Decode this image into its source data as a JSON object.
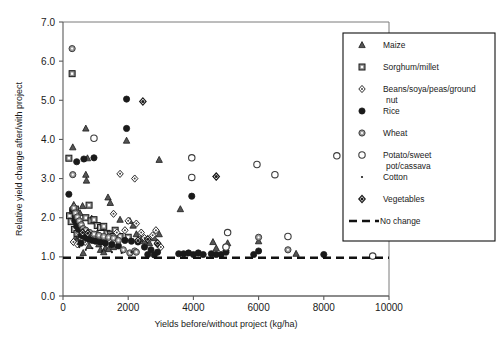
{
  "figure": {
    "faint_top_title": "",
    "background": "#ffffff"
  },
  "axes": {
    "y_title": "Relative yield change after/with project",
    "x_title": "Yields before/without project (kg/ha)",
    "y_ticks": [
      "0.0",
      "1.0",
      "2.0",
      "3.0",
      "4.0",
      "5.0",
      "6.0",
      "7.0"
    ],
    "x_ticks": [
      "0",
      "2000",
      "4000",
      "6000",
      "8000",
      "10000"
    ]
  },
  "legend": {
    "entries": [
      {
        "label": "Maize",
        "marker": "triangle-grey"
      },
      {
        "label": "Sorghum/millet",
        "marker": "square-grey"
      },
      {
        "label": "Beans/soya/peas/ground",
        "label2": "nut",
        "marker": "diamond-open"
      },
      {
        "label": "Rice",
        "marker": "circle-filled"
      },
      {
        "label": "Wheat",
        "marker": "circle-grey"
      },
      {
        "label": "Potato/sweet",
        "label2": "pot/cassava",
        "marker": "circle-open"
      },
      {
        "label": "Cotton",
        "marker": "dot-small"
      },
      {
        "label": "Vegetables",
        "marker": "diamond-grey"
      },
      {
        "label": "No change",
        "marker": "dashed-line"
      }
    ]
  },
  "chart_data": {
    "type": "scatter",
    "title": "",
    "xlabel": "Yields before/without project (kg/ha)",
    "ylabel": "Relative yield change after/with project",
    "xlim": [
      0,
      10000
    ],
    "ylim": [
      0.0,
      7.0
    ],
    "xticks": [
      0,
      2000,
      4000,
      6000,
      8000,
      10000
    ],
    "yticks": [
      0.0,
      1.0,
      2.0,
      3.0,
      4.0,
      5.0,
      6.0,
      7.0
    ],
    "grid": false,
    "legend_position": "right-inside",
    "reference_lines": [
      {
        "name": "No change",
        "orientation": "horizontal",
        "y": 1.0,
        "style": "dashed"
      }
    ],
    "series": [
      {
        "name": "Maize",
        "marker": "triangle-grey",
        "points": [
          [
            300,
            3.8
          ],
          [
            700,
            4.28
          ],
          [
            750,
            3.52
          ],
          [
            700,
            3.1
          ],
          [
            720,
            2.95
          ],
          [
            1950,
            3.97
          ],
          [
            2950,
            3.48
          ],
          [
            3600,
            2.22
          ],
          [
            1380,
            2.52
          ],
          [
            1450,
            2.38
          ],
          [
            330,
            2.33
          ],
          [
            360,
            2.05
          ],
          [
            520,
            2.12
          ],
          [
            600,
            2.3
          ],
          [
            880,
            1.98
          ],
          [
            1000,
            1.45
          ],
          [
            1100,
            1.32
          ],
          [
            1200,
            1.38
          ],
          [
            1300,
            1.22
          ],
          [
            1500,
            1.3
          ],
          [
            1750,
            1.95
          ],
          [
            2050,
            1.92
          ],
          [
            2150,
            1.8
          ],
          [
            2250,
            1.58
          ],
          [
            2400,
            1.45
          ],
          [
            2500,
            1.4
          ],
          [
            2650,
            1.35
          ],
          [
            2800,
            1.48
          ],
          [
            2950,
            1.58
          ],
          [
            4600,
            1.38
          ],
          [
            5050,
            1.35
          ],
          [
            6000,
            1.4
          ],
          [
            7150,
            1.08
          ],
          [
            1600,
            1.55
          ],
          [
            380,
            1.48
          ],
          [
            430,
            1.42
          ],
          [
            540,
            1.52
          ],
          [
            620,
            1.1
          ],
          [
            800,
            1.28
          ],
          [
            940,
            1.52
          ],
          [
            1050,
            1.6
          ],
          [
            1150,
            1.18
          ],
          [
            1250,
            1.12
          ],
          [
            1400,
            1.2
          ],
          [
            1550,
            1.25
          ],
          [
            5000,
            1.22
          ],
          [
            4700,
            1.22
          ]
        ]
      },
      {
        "name": "Sorghum/millet",
        "marker": "square-grey",
        "points": [
          [
            280,
            5.68
          ],
          [
            180,
            3.52
          ],
          [
            200,
            2.05
          ],
          [
            300,
            2.18
          ],
          [
            380,
            2.22
          ],
          [
            420,
            1.98
          ],
          [
            470,
            1.88
          ],
          [
            520,
            1.82
          ],
          [
            560,
            1.72
          ],
          [
            600,
            1.65
          ],
          [
            700,
            2.0
          ],
          [
            800,
            2.32
          ],
          [
            860,
            1.92
          ],
          [
            950,
            1.95
          ],
          [
            1050,
            1.8
          ],
          [
            1150,
            1.75
          ],
          [
            1250,
            1.78
          ],
          [
            1350,
            1.6
          ],
          [
            1450,
            1.58
          ],
          [
            1550,
            1.52
          ],
          [
            1750,
            1.52
          ],
          [
            2000,
            1.5
          ],
          [
            350,
            1.7
          ],
          [
            430,
            1.6
          ],
          [
            250,
            1.9
          ],
          [
            620,
            1.55
          ],
          [
            730,
            1.62
          ],
          [
            1600,
            1.68
          ]
        ]
      },
      {
        "name": "Beans/soya/peas/groundnut",
        "marker": "diamond-open",
        "points": [
          [
            1750,
            3.12
          ],
          [
            2200,
            3.0
          ],
          [
            2250,
            1.85
          ],
          [
            2000,
            1.92
          ],
          [
            1550,
            2.1
          ],
          [
            340,
            2.28
          ],
          [
            400,
            2.15
          ],
          [
            460,
            1.75
          ],
          [
            500,
            1.62
          ],
          [
            560,
            1.48
          ],
          [
            620,
            1.42
          ],
          [
            680,
            1.38
          ],
          [
            760,
            1.52
          ],
          [
            900,
            1.55
          ],
          [
            1000,
            1.48
          ],
          [
            1120,
            1.42
          ],
          [
            1280,
            1.5
          ],
          [
            1420,
            1.52
          ],
          [
            1650,
            1.62
          ],
          [
            2400,
            1.62
          ],
          [
            2500,
            1.48
          ],
          [
            2620,
            1.42
          ],
          [
            2750,
            1.55
          ],
          [
            2900,
            1.32
          ],
          [
            3000,
            1.25
          ],
          [
            4700,
            3.05
          ],
          [
            320,
            1.38
          ],
          [
            440,
            1.32
          ],
          [
            2850,
            1.68
          ],
          [
            1900,
            1.68
          ]
        ]
      },
      {
        "name": "Rice",
        "marker": "circle-filled",
        "points": [
          [
            1950,
            5.03
          ],
          [
            1950,
            4.28
          ],
          [
            950,
            3.53
          ],
          [
            420,
            3.43
          ],
          [
            180,
            2.6
          ],
          [
            3950,
            2.55
          ],
          [
            300,
            2.2
          ],
          [
            360,
            1.92
          ],
          [
            420,
            1.78
          ],
          [
            480,
            1.7
          ],
          [
            560,
            1.55
          ],
          [
            640,
            1.52
          ],
          [
            720,
            1.48
          ],
          [
            800,
            1.45
          ],
          [
            900,
            1.42
          ],
          [
            1000,
            1.4
          ],
          [
            1150,
            1.38
          ],
          [
            1300,
            1.35
          ],
          [
            1500,
            1.32
          ],
          [
            1700,
            1.28
          ],
          [
            1900,
            1.42
          ],
          [
            2100,
            1.4
          ],
          [
            2300,
            1.38
          ],
          [
            2500,
            1.25
          ],
          [
            2700,
            1.18
          ],
          [
            2900,
            1.12
          ],
          [
            3700,
            1.08
          ],
          [
            3850,
            1.1
          ],
          [
            4000,
            1.06
          ],
          [
            4150,
            1.1
          ],
          [
            4300,
            1.06
          ],
          [
            4550,
            1.08
          ],
          [
            4700,
            1.06
          ],
          [
            4850,
            1.06
          ],
          [
            5000,
            1.12
          ],
          [
            5850,
            1.06
          ],
          [
            6000,
            1.15
          ],
          [
            8000,
            1.06
          ],
          [
            550,
            1.35
          ],
          [
            3550,
            1.08
          ],
          [
            2800,
            1.05
          ],
          [
            2600,
            1.06
          ],
          [
            640,
            3.5
          ]
        ]
      },
      {
        "name": "Wheat",
        "marker": "circle-grey",
        "points": [
          [
            280,
            6.32
          ],
          [
            300,
            3.1
          ],
          [
            330,
            2.25
          ],
          [
            380,
            2.12
          ],
          [
            440,
            2.02
          ],
          [
            500,
            1.92
          ],
          [
            560,
            1.82
          ],
          [
            620,
            1.72
          ],
          [
            700,
            1.68
          ],
          [
            820,
            1.62
          ],
          [
            950,
            1.58
          ],
          [
            1100,
            1.55
          ],
          [
            1250,
            1.52
          ],
          [
            1400,
            1.5
          ],
          [
            1550,
            1.48
          ],
          [
            2200,
            1.15
          ],
          [
            5000,
            1.25
          ],
          [
            6000,
            1.5
          ],
          [
            6900,
            1.18
          ],
          [
            2250,
            1.12
          ],
          [
            1700,
            1.42
          ],
          [
            1850,
            1.18
          ],
          [
            2050,
            1.1
          ]
        ]
      },
      {
        "name": "Potato/sweet pot/cassava",
        "marker": "circle-open",
        "points": [
          [
            950,
            4.03
          ],
          [
            3950,
            3.53
          ],
          [
            3950,
            3.03
          ],
          [
            5950,
            3.36
          ],
          [
            6500,
            3.1
          ],
          [
            8400,
            3.58
          ],
          [
            5050,
            1.62
          ],
          [
            6900,
            1.52
          ],
          [
            5000,
            1.25
          ],
          [
            9500,
            1.02
          ]
        ]
      },
      {
        "name": "Cotton",
        "marker": "dot-small",
        "points": [
          [
            500,
            1.25
          ],
          [
            700,
            1.18
          ],
          [
            900,
            1.22
          ],
          [
            1200,
            1.15
          ],
          [
            1500,
            1.12
          ],
          [
            1800,
            1.1
          ],
          [
            2100,
            1.12
          ]
        ]
      },
      {
        "name": "Vegetables",
        "marker": "diamond-grey",
        "points": [
          [
            2450,
            4.97
          ],
          [
            4700,
            3.05
          ],
          [
            2300,
            1.42
          ],
          [
            2600,
            1.45
          ],
          [
            2900,
            1.35
          ],
          [
            600,
            1.62
          ],
          [
            760,
            1.6
          ]
        ]
      }
    ]
  }
}
